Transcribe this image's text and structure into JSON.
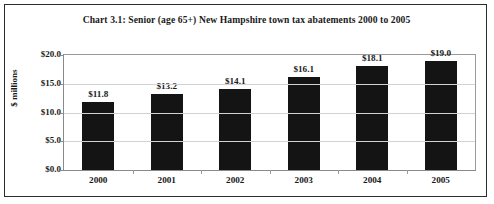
{
  "chart_data": {
    "type": "bar",
    "title": "Chart 3.1: Senior (age 65+) New Hampshire town tax abatements  2000 to 2005",
    "xlabel": "",
    "ylabel": "$ millions",
    "categories": [
      "2000",
      "2001",
      "2002",
      "2003",
      "2004",
      "2005"
    ],
    "values": [
      11.8,
      13.2,
      14.1,
      16.1,
      18.1,
      19.0
    ],
    "data_labels": [
      "$11.8",
      "$13.2",
      "$14.1",
      "$16.1",
      "$18.1",
      "$19.0"
    ],
    "ylim": [
      0,
      20
    ],
    "ytick_values": [
      0,
      5,
      10,
      15,
      20
    ],
    "ytick_labels": [
      "$0.0",
      "$5.0",
      "$10.0",
      "$15.0",
      "$20.0"
    ],
    "grid": true,
    "legend": false,
    "series_color": "#141414",
    "gridline_color": "#d2d2d2",
    "axis_color": "#8a8a8a",
    "text_color": "#1a1a1a",
    "background": "#ffffff",
    "border_color": "#2b2b2b"
  }
}
